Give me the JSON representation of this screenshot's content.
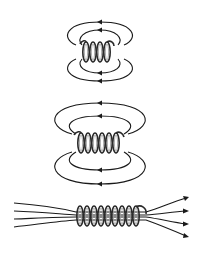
{
  "diagram": {
    "panels": [
      {
        "id": "short-coil",
        "turns": 4,
        "loops_above": 2,
        "loops_below": 2,
        "arrow_direction": "left"
      },
      {
        "id": "medium-coil",
        "turns": 6,
        "loops_above": 2,
        "loops_below": 2,
        "arrow_direction": "left"
      },
      {
        "id": "long-coil",
        "turns": 9,
        "field_lines": 4,
        "arrow_direction": "right"
      }
    ],
    "colors": {
      "line": "#1a1a1a",
      "background": "#ffffff"
    }
  }
}
